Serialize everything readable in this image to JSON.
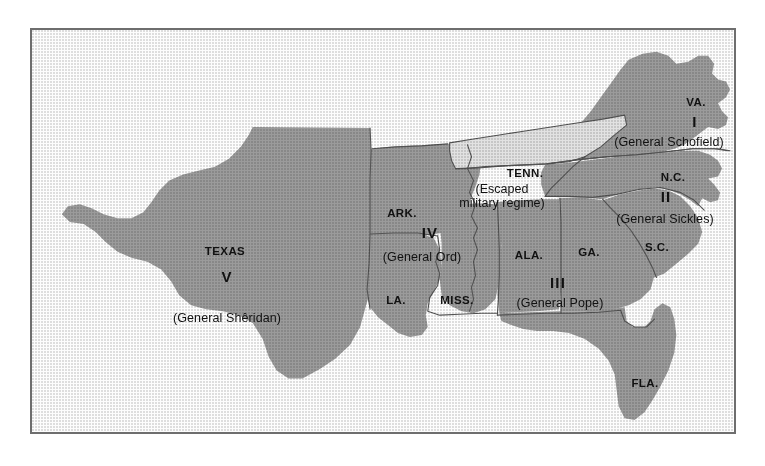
{
  "figure": {
    "kind": "historical-map",
    "frame_border_color": "#6e6e6e",
    "background_color": "#ffffff"
  },
  "palette": {
    "land_gray": "#9b9b9b",
    "tennessee_light_gray": "#e2e2e2",
    "state_border": "#555555",
    "coastline": "#7d7d7d",
    "label_text": "#111111"
  },
  "map": {
    "states": [
      {
        "id": "texas",
        "label": "TEXAS",
        "x": 193,
        "y": 220,
        "fill": "land_gray"
      },
      {
        "id": "arkansas",
        "label": "ARK.",
        "x": 370,
        "y": 182,
        "fill": "land_gray"
      },
      {
        "id": "louisiana",
        "label": "LA.",
        "x": 364,
        "y": 269,
        "fill": "land_gray"
      },
      {
        "id": "mississippi",
        "label": "MISS.",
        "x": 425,
        "y": 269,
        "fill": "land_gray"
      },
      {
        "id": "alabama",
        "label": "ALA.",
        "x": 497,
        "y": 224,
        "fill": "land_gray"
      },
      {
        "id": "georgia",
        "label": "GA.",
        "x": 557,
        "y": 221,
        "fill": "land_gray"
      },
      {
        "id": "florida",
        "label": "FLA.",
        "x": 613,
        "y": 352,
        "fill": "land_gray"
      },
      {
        "id": "south-carolina",
        "label": "S.C.",
        "x": 625,
        "y": 216,
        "fill": "land_gray"
      },
      {
        "id": "north-carolina",
        "label": "N.C.",
        "x": 641,
        "y": 147,
        "fill": "land_gray"
      },
      {
        "id": "virginia",
        "label": "VA.",
        "x": 664,
        "y": 72,
        "fill": "land_gray"
      },
      {
        "id": "tennessee",
        "label": "TENN.",
        "x": 493,
        "y": 142,
        "fill": "tennessee_light_gray"
      }
    ],
    "districts": [
      {
        "id": "district-1",
        "numeral": "I",
        "numeral_x": 663,
        "numeral_y": 90,
        "commander": "(General Schofield)",
        "commander_x": 637,
        "commander_y": 110,
        "states": [
          "VA."
        ]
      },
      {
        "id": "district-2",
        "numeral": "II",
        "numeral_x": 634,
        "numeral_y": 165,
        "commander": "(General Sickles)",
        "commander_x": 633,
        "commander_y": 188,
        "states": [
          "N.C.",
          "S.C."
        ]
      },
      {
        "id": "district-3",
        "numeral": "III",
        "numeral_x": 526,
        "numeral_y": 251,
        "commander": "(General Pope)",
        "commander_x": 528,
        "commander_y": 271,
        "states": [
          "ALA.",
          "GA.",
          "FLA."
        ]
      },
      {
        "id": "district-4",
        "numeral": "IV",
        "numeral_x": 398,
        "numeral_y": 201,
        "commander": "(General Ord)",
        "commander_x": 390,
        "commander_y": 225,
        "states": [
          "ARK.",
          "MISS."
        ]
      },
      {
        "id": "district-5",
        "numeral": "V",
        "numeral_x": 195,
        "numeral_y": 245,
        "commander": "(General Shêridan)",
        "commander_x": 195,
        "commander_y": 286,
        "states": [
          "TEXAS",
          "LA."
        ]
      }
    ],
    "annotations": [
      {
        "id": "tennessee-note",
        "line1": "(Escaped",
        "line2": "military regime)",
        "x": 470,
        "y": 165
      }
    ]
  }
}
